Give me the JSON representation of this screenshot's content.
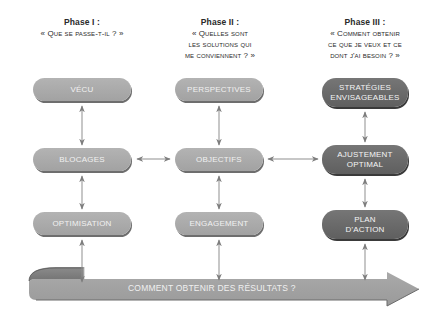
{
  "phases": [
    {
      "title": "Phase I :",
      "question_lines": [
        "« Que se passe-t-il ? »"
      ]
    },
    {
      "title": "Phase II :",
      "question_lines": [
        "« Quelles sont",
        "les solutions qui",
        "me conviennent ? »"
      ]
    },
    {
      "title": "Phase III :",
      "question_lines": [
        "« Comment obtenir",
        "ce que je veux et ce",
        "dont j'ai besoin ? »"
      ]
    }
  ],
  "columns": [
    {
      "boxes": [
        {
          "label": "Vécu"
        },
        {
          "label": "Blocages"
        },
        {
          "label": "Optimisation"
        }
      ]
    },
    {
      "boxes": [
        {
          "label": "Perspectives"
        },
        {
          "label": "Objectifs"
        },
        {
          "label": "Engagement"
        }
      ]
    },
    {
      "boxes": [
        {
          "label_lines": [
            "Stratégies",
            "envisageables"
          ]
        },
        {
          "label_lines": [
            "Ajustement",
            "optimal"
          ]
        },
        {
          "label_lines": [
            "Plan",
            "d'action"
          ]
        }
      ]
    }
  ],
  "banner": {
    "label": "Comment obtenir des résultats ?"
  },
  "colors": {
    "light_box": "#a8a8a8",
    "dark_box": "#6b6b6b",
    "arrow": "#8a8a8a",
    "text": "#2a2a2a"
  }
}
